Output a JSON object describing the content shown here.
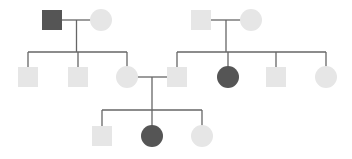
{
  "diagram": {
    "type": "pedigree",
    "colors": {
      "affected": "#555555",
      "unaffected": "#e6e6e6",
      "line": "#666666",
      "background": "#ffffff"
    },
    "individuals": [
      {
        "id": "I-1",
        "sex": "male",
        "affected": true,
        "generation": 1
      },
      {
        "id": "I-2",
        "sex": "female",
        "affected": false,
        "generation": 1
      },
      {
        "id": "I-3",
        "sex": "male",
        "affected": false,
        "generation": 1
      },
      {
        "id": "I-4",
        "sex": "female",
        "affected": false,
        "generation": 1
      },
      {
        "id": "II-1",
        "sex": "male",
        "affected": false,
        "generation": 2,
        "parents": [
          "I-1",
          "I-2"
        ]
      },
      {
        "id": "II-2",
        "sex": "male",
        "affected": false,
        "generation": 2,
        "parents": [
          "I-1",
          "I-2"
        ]
      },
      {
        "id": "II-3",
        "sex": "female",
        "affected": false,
        "generation": 2,
        "parents": [
          "I-1",
          "I-2"
        ]
      },
      {
        "id": "II-4",
        "sex": "male",
        "affected": false,
        "generation": 2,
        "parents": [
          "I-3",
          "I-4"
        ]
      },
      {
        "id": "II-5",
        "sex": "female",
        "affected": true,
        "generation": 2,
        "parents": [
          "I-3",
          "I-4"
        ]
      },
      {
        "id": "II-6",
        "sex": "male",
        "affected": false,
        "generation": 2,
        "parents": [
          "I-3",
          "I-4"
        ]
      },
      {
        "id": "II-7",
        "sex": "female",
        "affected": false,
        "generation": 2,
        "parents": [
          "I-3",
          "I-4"
        ]
      },
      {
        "id": "III-1",
        "sex": "male",
        "affected": false,
        "generation": 3,
        "parents": [
          "II-3",
          "II-4"
        ]
      },
      {
        "id": "III-2",
        "sex": "female",
        "affected": true,
        "generation": 3,
        "parents": [
          "II-3",
          "II-4"
        ]
      },
      {
        "id": "III-3",
        "sex": "female",
        "affected": false,
        "generation": 3,
        "parents": [
          "II-3",
          "II-4"
        ]
      }
    ],
    "couples": [
      {
        "partners": [
          "I-1",
          "I-2"
        ],
        "children": [
          "II-1",
          "II-2",
          "II-3"
        ]
      },
      {
        "partners": [
          "I-3",
          "I-4"
        ],
        "children": [
          "II-4",
          "II-5",
          "II-6",
          "II-7"
        ]
      },
      {
        "partners": [
          "II-3",
          "II-4"
        ],
        "children": [
          "III-1",
          "III-2",
          "III-3"
        ]
      }
    ]
  }
}
